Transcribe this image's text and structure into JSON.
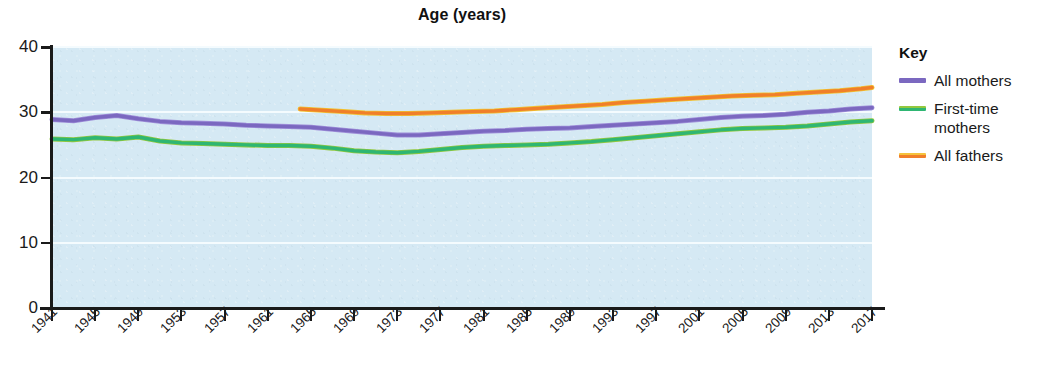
{
  "chart_data": {
    "type": "line",
    "title": "Age (years)",
    "xlabel": "",
    "ylabel": "",
    "ylim": [
      0,
      40
    ],
    "yticks": [
      0,
      10,
      20,
      30,
      40
    ],
    "ytick_labels": [
      "0",
      "10",
      "20",
      "30",
      "40"
    ],
    "xlim": [
      1941,
      2017
    ],
    "xticks": [
      1941,
      1945,
      1949,
      1953,
      1957,
      1961,
      1965,
      1969,
      1973,
      1977,
      1981,
      1985,
      1989,
      1993,
      1997,
      2001,
      2005,
      2009,
      2013,
      2017
    ],
    "xtick_labels": [
      "1941",
      "1945",
      "1949",
      "1953",
      "1957",
      "1961",
      "1965",
      "1969",
      "1973",
      "1977",
      "1981",
      "1985",
      "1989",
      "1993",
      "1997",
      "2001",
      "2005",
      "2009",
      "2013",
      "2017"
    ],
    "grid": "horizontal-white",
    "legend_position": "right",
    "legend_title": "Key",
    "plot_background": "#d5e9f4",
    "series": [
      {
        "name": "All mothers",
        "color": "#7b68c0",
        "x": [
          1941,
          1943,
          1945,
          1947,
          1949,
          1951,
          1953,
          1955,
          1957,
          1959,
          1961,
          1963,
          1965,
          1967,
          1969,
          1971,
          1973,
          1975,
          1977,
          1979,
          1981,
          1983,
          1985,
          1987,
          1989,
          1991,
          1993,
          1995,
          1997,
          1999,
          2001,
          2003,
          2005,
          2007,
          2009,
          2011,
          2013,
          2015,
          2017
        ],
        "values": [
          28.9,
          28.7,
          29.2,
          29.5,
          29.0,
          28.6,
          28.4,
          28.3,
          28.2,
          28.0,
          27.9,
          27.8,
          27.7,
          27.4,
          27.1,
          26.8,
          26.5,
          26.5,
          26.7,
          26.9,
          27.1,
          27.2,
          27.4,
          27.5,
          27.6,
          27.8,
          28.0,
          28.2,
          28.4,
          28.6,
          28.9,
          29.2,
          29.4,
          29.5,
          29.7,
          30.0,
          30.2,
          30.5,
          30.7
        ],
        "note": "Average age of all mothers at childbirth"
      },
      {
        "name": "First-time mothers",
        "color": "#2fb673",
        "x": [
          1941,
          1943,
          1945,
          1947,
          1949,
          1951,
          1953,
          1955,
          1957,
          1959,
          1961,
          1963,
          1965,
          1967,
          1969,
          1971,
          1973,
          1975,
          1977,
          1979,
          1981,
          1983,
          1985,
          1987,
          1989,
          1991,
          1993,
          1995,
          1997,
          1999,
          2001,
          2003,
          2005,
          2007,
          2009,
          2011,
          2013,
          2015,
          2017
        ],
        "values": [
          25.9,
          25.8,
          26.1,
          25.9,
          26.2,
          25.6,
          25.3,
          25.2,
          25.1,
          25.0,
          24.9,
          24.9,
          24.8,
          24.5,
          24.1,
          23.9,
          23.8,
          24.0,
          24.3,
          24.6,
          24.8,
          24.9,
          25.0,
          25.1,
          25.3,
          25.5,
          25.8,
          26.1,
          26.4,
          26.7,
          27.0,
          27.3,
          27.5,
          27.6,
          27.7,
          27.9,
          28.2,
          28.5,
          28.7
        ],
        "note": "Average age of first-time mothers at childbirth"
      },
      {
        "name": "All fathers",
        "color": "#f07f2a",
        "x": [
          1964,
          1966,
          1968,
          1970,
          1972,
          1974,
          1976,
          1978,
          1980,
          1982,
          1984,
          1986,
          1988,
          1990,
          1992,
          1994,
          1996,
          1998,
          2000,
          2002,
          2004,
          2006,
          2008,
          2010,
          2012,
          2014,
          2016,
          2017
        ],
        "values": [
          30.5,
          30.3,
          30.1,
          29.9,
          29.8,
          29.8,
          29.9,
          30.0,
          30.1,
          30.2,
          30.4,
          30.6,
          30.8,
          31.0,
          31.2,
          31.5,
          31.7,
          31.9,
          32.1,
          32.3,
          32.5,
          32.6,
          32.7,
          32.9,
          33.1,
          33.3,
          33.6,
          33.8
        ],
        "note": "Average age of all fathers at childbirth"
      }
    ]
  },
  "legend": {
    "title": "Key",
    "items": [
      {
        "label": "All mothers",
        "color": "#7b68c0",
        "style": "solid"
      },
      {
        "label": "First-time\nmothers",
        "label_line1": "First-time",
        "label_line2": "mothers",
        "color": "#2fb673",
        "style": "two-tone"
      },
      {
        "label": "All fathers",
        "color": "#f07f2a",
        "style": "solid"
      }
    ]
  }
}
